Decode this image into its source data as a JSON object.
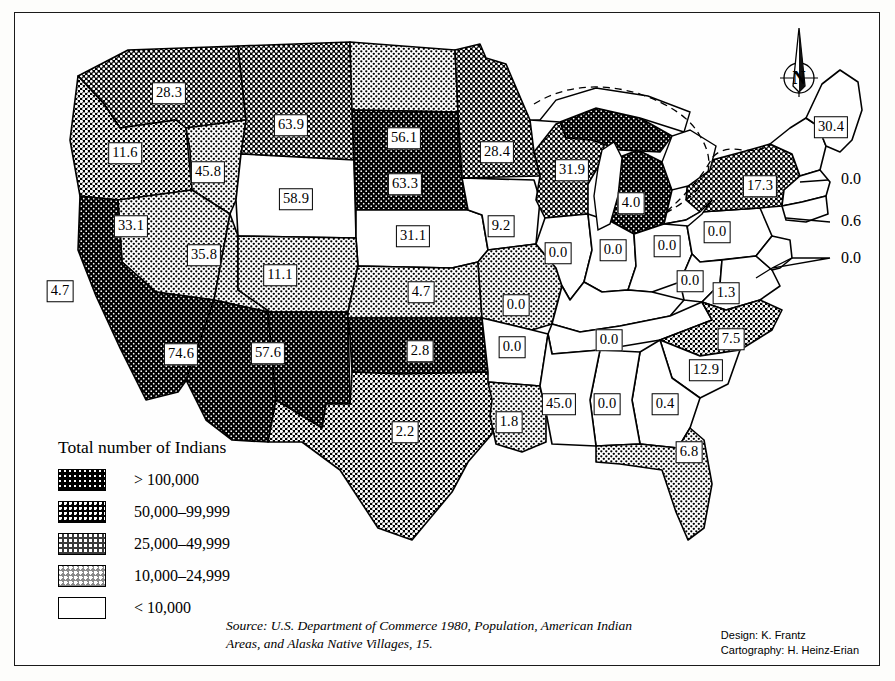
{
  "figure": {
    "north_label": "N"
  },
  "legend": {
    "title": "Total number of Indians",
    "classes": [
      {
        "key": "c1",
        "label": "> 100,000",
        "swatch": "very-dark-stipple"
      },
      {
        "key": "c2",
        "label": "50,000–99,999",
        "swatch": "dark-stipple"
      },
      {
        "key": "c3",
        "label": "25,000–49,999",
        "swatch": "medium-stipple"
      },
      {
        "key": "c4",
        "label": "10,000–24,999",
        "swatch": "light-stipple"
      },
      {
        "key": "c5",
        "label": "< 10,000",
        "swatch": "white"
      }
    ]
  },
  "source": {
    "line1": "Source: U.S. Department of Commerce 1980, Population, American Indian",
    "line2": "Areas, and Alaska Native Villages, 15."
  },
  "credits": {
    "design": "Design: K. Frantz",
    "cartography": "Cartography: H. Heinz-Erian"
  },
  "chart_data": {
    "type": "map",
    "title": "Total number of Indians",
    "legend_position": "lower-left",
    "class_breaks": [
      "> 100,000",
      "50,000–99,999",
      "25,000–49,999",
      "10,000–24,999",
      "< 10,000"
    ],
    "value_unit": "percent",
    "states": [
      {
        "code": "WA",
        "value": "28.3",
        "class": "c2",
        "x": 169,
        "y": 93
      },
      {
        "code": "OR",
        "value": "11.6",
        "class": "c3",
        "x": 125,
        "y": 153
      },
      {
        "code": "ID",
        "value": "45.8",
        "class": "c4",
        "x": 208,
        "y": 172
      },
      {
        "code": "MT",
        "value": "63.9",
        "class": "c2",
        "x": 291,
        "y": 125
      },
      {
        "code": "ND",
        "value": "56.1",
        "class": "c4",
        "x": 404,
        "y": 138
      },
      {
        "code": "MN",
        "value": "28.4",
        "class": "c2",
        "x": 497,
        "y": 152
      },
      {
        "code": "SD",
        "value": "63.3",
        "class": "c1",
        "x": 405,
        "y": 184
      },
      {
        "code": "WY",
        "value": "58.9",
        "class": "c5",
        "x": 296,
        "y": 199
      },
      {
        "code": "NV",
        "value": "33.1",
        "class": "c4",
        "x": 131,
        "y": 226
      },
      {
        "code": "UT",
        "value": "35.8",
        "class": "c4",
        "x": 204,
        "y": 255
      },
      {
        "code": "CA",
        "value": "4.7",
        "class": "c1",
        "x": 60,
        "y": 291
      },
      {
        "code": "CO",
        "value": "11.1",
        "class": "c4",
        "x": 280,
        "y": 275
      },
      {
        "code": "NE",
        "value": "31.1",
        "class": "c5",
        "x": 413,
        "y": 236
      },
      {
        "code": "IA",
        "value": "9.2",
        "class": "c5",
        "x": 501,
        "y": 226
      },
      {
        "code": "WI",
        "value": "31.9",
        "class": "c2",
        "x": 572,
        "y": 170
      },
      {
        "code": "MI",
        "value": "4.0",
        "class": "c1",
        "x": 631,
        "y": 203
      },
      {
        "code": "KS",
        "value": "4.7",
        "class": "c4",
        "x": 421,
        "y": 292
      },
      {
        "code": "MO",
        "value": "0.0",
        "class": "c4",
        "x": 516,
        "y": 305
      },
      {
        "code": "IL",
        "value": "0.0",
        "class": "c5",
        "x": 558,
        "y": 253
      },
      {
        "code": "IN",
        "value": "0.0",
        "class": "c5",
        "x": 613,
        "y": 250
      },
      {
        "code": "OH",
        "value": "0.0",
        "class": "c5",
        "x": 667,
        "y": 246
      },
      {
        "code": "NY",
        "value": "17.3",
        "class": "c2",
        "x": 760,
        "y": 186
      },
      {
        "code": "ME",
        "value": "30.4",
        "class": "c5",
        "x": 831,
        "y": 127
      },
      {
        "code": "PA",
        "value": "0.0",
        "class": "c5",
        "x": 717,
        "y": 232
      },
      {
        "code": "WV",
        "value": "0.0",
        "class": "c5",
        "x": 690,
        "y": 281
      },
      {
        "code": "VA",
        "value": "1.3",
        "class": "c5",
        "x": 726,
        "y": 293
      },
      {
        "code": "AZ",
        "value": "74.6",
        "class": "c1",
        "x": 181,
        "y": 354
      },
      {
        "code": "NM",
        "value": "57.6",
        "class": "c1",
        "x": 268,
        "y": 353
      },
      {
        "code": "OK",
        "value": "2.8",
        "class": "c1",
        "x": 420,
        "y": 351
      },
      {
        "code": "AR",
        "value": "0.0",
        "class": "c5",
        "x": 512,
        "y": 347
      },
      {
        "code": "KY",
        "value": "0.0",
        "class": "c5",
        "x": 609,
        "y": 340
      },
      {
        "code": "NC",
        "value": "7.5",
        "class": "c3",
        "x": 731,
        "y": 339
      },
      {
        "code": "SC",
        "value": "12.9",
        "class": "c5",
        "x": 706,
        "y": 370
      },
      {
        "code": "TX",
        "value": "2.2",
        "class": "c3",
        "x": 405,
        "y": 432
      },
      {
        "code": "LA",
        "value": "1.8",
        "class": "c4",
        "x": 509,
        "y": 422
      },
      {
        "code": "MS",
        "value": "45.0",
        "class": "c5",
        "x": 559,
        "y": 404
      },
      {
        "code": "AL",
        "value": "0.0",
        "class": "c5",
        "x": 607,
        "y": 404
      },
      {
        "code": "GA",
        "value": "0.4",
        "class": "c5",
        "x": 665,
        "y": 404
      },
      {
        "code": "FL",
        "value": "6.8",
        "class": "c4",
        "x": 689,
        "y": 452
      }
    ],
    "callouts": [
      {
        "label": "0.0",
        "x": 851,
        "y": 179
      },
      {
        "label": "0.6",
        "x": 851,
        "y": 221
      },
      {
        "label": "0.0",
        "x": 851,
        "y": 258
      }
    ]
  }
}
